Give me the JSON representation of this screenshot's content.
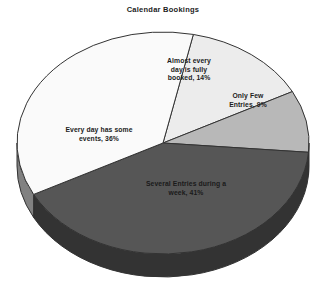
{
  "chart": {
    "title": "Calendar Bookings"
  },
  "chart_data": {
    "type": "pie",
    "title": "Calendar Bookings",
    "xlabel": "",
    "ylabel": "",
    "legend": "none",
    "grid": false,
    "three_d": true,
    "categories": [
      "Almost every day is fully booked",
      "Only Few Entries",
      "Several Entries during a week",
      "Every day has some events"
    ],
    "values": [
      14,
      9,
      41,
      36
    ],
    "unit": "%",
    "slices": [
      {
        "name": "almost-every-day-fully-booked",
        "label": "Almost every\nday is fully\nbooked, 14%",
        "category": "Almost every day is fully booked",
        "value": 14,
        "color": "#ececec",
        "side_color": "#bdbdbd",
        "label_color": "#1c1c1c"
      },
      {
        "name": "only-few-entries",
        "label": "Only Few\nEntries, 9%",
        "category": "Only Few Entries",
        "value": 9,
        "color": "#b8b8b8",
        "side_color": "#8f8f8f",
        "label_color": "#1c1c1c"
      },
      {
        "name": "several-entries-during-a-week",
        "label": "Several Entries during a\nweek, 41%",
        "category": "Several Entries during a week",
        "value": 41,
        "color": "#565656",
        "side_color": "#333333",
        "label_color": "#1a1a1a"
      },
      {
        "name": "every-day-has-some-events",
        "label": "Every day has some\nevents, 36%",
        "category": "Every day has some events",
        "value": 36,
        "color": "#fafafa",
        "side_color": "#818181",
        "label_color": "#1c1c1c"
      }
    ],
    "colors": {
      "background": "#ffffff",
      "outline": "#333333",
      "title_color": "#1c1c1c"
    }
  }
}
